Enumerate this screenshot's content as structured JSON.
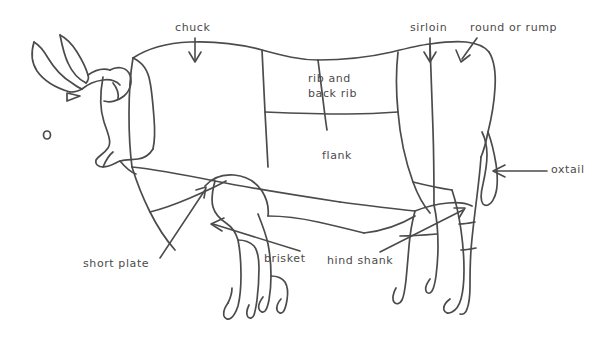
{
  "diagram": {
    "style": "hand-drawn line art",
    "background_color": "#ffffff",
    "line_color": "#4b4b4b",
    "text_color": "#4b4b4b",
    "canvas": {
      "width": 616,
      "height": 348
    }
  },
  "labels": {
    "chuck": "chuck",
    "sirloin": "sirloin",
    "round_or_rump": "round or rump",
    "rib_line1": "rib and",
    "rib_line2": "back rib",
    "flank": "flank",
    "oxtail": "oxtail",
    "short_plate": "short plate",
    "brisket": "brisket",
    "hind_shank": "hind shank"
  },
  "annotations": [
    {
      "label": "chuck",
      "pointer": "arrow-down",
      "text_x": 175,
      "text_y": 21,
      "tip_x": 195,
      "tip_y": 62
    },
    {
      "label": "sirloin",
      "pointer": "arrow-down",
      "text_x": 410,
      "text_y": 21,
      "tip_x": 430,
      "tip_y": 62
    },
    {
      "label": "round or rump",
      "pointer": "arrow-down",
      "text_x": 470,
      "text_y": 21,
      "tip_x": 461,
      "tip_y": 62
    },
    {
      "label": "rib and back rib",
      "pointer": "none",
      "text_x": 308,
      "text_y": 71
    },
    {
      "label": "flank",
      "pointer": "none",
      "text_x": 322,
      "text_y": 149
    },
    {
      "label": "oxtail",
      "pointer": "arrow-left",
      "text_x": 551,
      "text_y": 163,
      "tip_x": 494,
      "tip_y": 171
    },
    {
      "label": "short plate",
      "pointer": "arrow-up-right",
      "text_x": 83,
      "text_y": 257,
      "tip_x": 205,
      "tip_y": 188
    },
    {
      "label": "brisket",
      "pointer": "arrow-left",
      "text_x": 264,
      "text_y": 252,
      "tip_x": 211,
      "tip_y": 225
    },
    {
      "label": "hind shank",
      "pointer": "arrow-up-right",
      "text_x": 327,
      "text_y": 254,
      "tip_x": 463,
      "tip_y": 208
    }
  ]
}
